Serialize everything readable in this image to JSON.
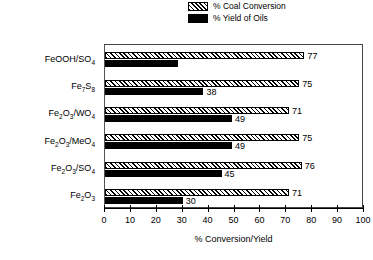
{
  "chart_data": {
    "type": "bar",
    "orientation": "horizontal",
    "title": "",
    "xlabel": "% Conversion/Yield",
    "ylabel": "",
    "xlim": [
      0,
      100
    ],
    "xticks": [
      0,
      10,
      20,
      30,
      40,
      50,
      60,
      70,
      80,
      90,
      100
    ],
    "grid": false,
    "legend_position": "top-right",
    "categories": [
      "FeOOH/SO4",
      "Fe7S8",
      "Fe2O3/WO4",
      "Fe2O3/MeO4",
      "Fe2O3/SO4",
      "Fe2O3"
    ],
    "category_labels_html": [
      "FeOOH/SO<sub>4</sub>",
      "Fe<sub>7</sub>S<sub>8</sub>",
      "Fe<sub>2</sub>O<sub>3</sub>/WO<sub>4</sub>",
      "Fe<sub>2</sub>O<sub>3</sub>/MeO<sub>4</sub>",
      "Fe<sub>2</sub>O<sub>3</sub>/SO<sub>4</sub>",
      "Fe<sub>2</sub>O<sub>3</sub>"
    ],
    "series": [
      {
        "name": "% Coal Conversion",
        "pattern": "hatched",
        "values": [
          77,
          75,
          71,
          75,
          76,
          71
        ],
        "data_labels": [
          "77",
          "75",
          "71",
          "75",
          "76",
          "71"
        ]
      },
      {
        "name": "% Yield of Oils",
        "pattern": "solid-black",
        "values": [
          28,
          38,
          49,
          49,
          45,
          30
        ],
        "data_labels": [
          "",
          "38",
          "49",
          "49",
          "45",
          "30"
        ]
      }
    ]
  },
  "legend": {
    "items": [
      {
        "label": "% Coal Conversion",
        "swatch": "hatched-swatch"
      },
      {
        "label": "% Yield of Oils",
        "swatch": "solid-black-swatch"
      }
    ]
  },
  "axis": {
    "x_title": "% Conversion/Yield",
    "tick_labels": [
      "0",
      "10",
      "20",
      "30",
      "40",
      "50",
      "60",
      "70",
      "80",
      "90",
      "100"
    ]
  },
  "colors": {
    "hatch_line": "#000000",
    "hatch_background": "#ffffff",
    "solid_bar": "#000000",
    "frame": "#444444",
    "text": "#000000",
    "page_background": "#ffffff"
  }
}
